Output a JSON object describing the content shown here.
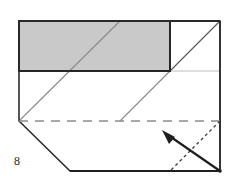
{
  "figure": {
    "label": "8",
    "kind": "origami-fold-diagram",
    "caption": ""
  },
  "canvas": {
    "width": 235,
    "height": 185,
    "background": "#ffffff"
  },
  "palette": {
    "outline": "#2b2b2b",
    "outline_thick": "#1f1f1f",
    "crease_thin": "#7a7a7a",
    "crease_light": "#b8b8b8",
    "dashed": "#8a8a8a",
    "dotted": "#3a3a3a",
    "shaded_fill": "#c9c9c9",
    "paper_fill": "#ffffff",
    "arrow": "#1f1f1f"
  },
  "shapes": {
    "sheet_outline": {
      "name": "sheet-outline",
      "points": "19,21 220,21 220,171 70,171 19,121"
    },
    "shaded_flap": {
      "name": "shaded-flap",
      "points": "19,21 170,21 170,71 19,71",
      "fill": "#c9c9c9"
    },
    "white_square": {
      "name": "white-square",
      "points": "170,21 220,21 220,71 170,71",
      "fill": "#ffffff"
    }
  },
  "creases": {
    "horizontal_edge_right": {
      "name": "light-horizontal-crease",
      "x1": 170,
      "y1": 71,
      "x2": 220,
      "y2": 71
    },
    "diagonal_main": {
      "name": "main-diagonal-crease",
      "x1": 19,
      "y1": 121,
      "x2": 120,
      "y2": 21
    },
    "diagonal_second_lower": {
      "name": "second-diagonal-lower",
      "x1": 120,
      "y1": 121,
      "x2": 170,
      "y2": 71
    },
    "diagonal_second_upper": {
      "name": "second-diagonal-upper",
      "x1": 170,
      "y1": 71,
      "x2": 220,
      "y2": 21
    },
    "square_diagonal": {
      "name": "white-square-diagonal",
      "x1": 170,
      "y1": 71,
      "x2": 220,
      "y2": 21
    },
    "valley_fold": {
      "name": "valley-fold-dashed",
      "x1": 19,
      "y1": 121,
      "x2": 220,
      "y2": 121,
      "dash": "9 7"
    },
    "hidden_fold": {
      "name": "hidden-fold-dotted",
      "x1": 220,
      "y1": 121,
      "x2": 170,
      "y2": 171,
      "dash": "3 3"
    }
  },
  "arrow": {
    "name": "fold-direction-arrow",
    "x1": 220,
    "y1": 171,
    "x2": 166,
    "y2": 134,
    "head": "164,132 176,138 171,145",
    "stroke_width": 2.2
  }
}
